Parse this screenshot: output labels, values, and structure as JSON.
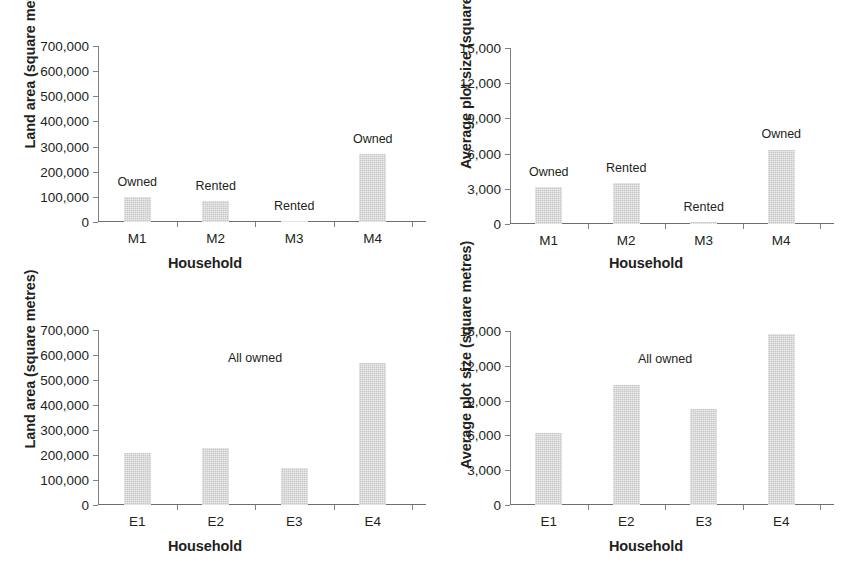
{
  "figure": {
    "bar_color": "#c8c8c8",
    "axis_color": "#808080",
    "text_color": "#231f20"
  },
  "chart_data": [
    {
      "id": "panel-top-left",
      "type": "bar",
      "title": "",
      "xlabel": "Household",
      "ylabel": "Land area (square metres)",
      "categories": [
        "M1",
        "M2",
        "M3",
        "M4"
      ],
      "values": [
        98000,
        82000,
        2000,
        270000
      ],
      "annotations": [
        "Owned",
        "Rented",
        "Rented",
        "Owned"
      ],
      "ylim": [
        0,
        700000
      ],
      "yticks": [
        0,
        100000,
        200000,
        300000,
        400000,
        500000,
        600000,
        700000
      ],
      "ytick_labels": [
        "0",
        "100,000",
        "200,000",
        "300,000",
        "400,000",
        "500,000",
        "600,000",
        "700,000"
      ],
      "grid": false,
      "legend": "none"
    },
    {
      "id": "panel-top-right",
      "type": "bar",
      "title": "",
      "xlabel": "Household",
      "ylabel": "Average plot size (square metres)",
      "categories": [
        "M1",
        "M2",
        "M3",
        "M4"
      ],
      "values": [
        3150,
        3500,
        150,
        6350
      ],
      "annotations": [
        "Owned",
        "Rented",
        "Rented",
        "Owned"
      ],
      "ylim": [
        0,
        15000
      ],
      "yticks": [
        0,
        3000,
        6000,
        9000,
        12000,
        15000
      ],
      "ytick_labels": [
        "0",
        "3,000",
        "6,000",
        "9,000",
        "12,000",
        "15,000"
      ],
      "grid": false,
      "legend": "none"
    },
    {
      "id": "panel-bottom-left",
      "type": "bar",
      "title": "",
      "xlabel": "Household",
      "ylabel": "Land area (square metres)",
      "categories": [
        "E1",
        "E2",
        "E3",
        "E4"
      ],
      "values": [
        210000,
        228000,
        148000,
        567000
      ],
      "annotations": [
        "",
        "",
        "",
        ""
      ],
      "panel_note": "All owned",
      "ylim": [
        0,
        700000
      ],
      "yticks": [
        0,
        100000,
        200000,
        300000,
        400000,
        500000,
        600000,
        700000
      ],
      "ytick_labels": [
        "0",
        "100,000",
        "200,000",
        "300,000",
        "400,000",
        "500,000",
        "600,000",
        "700,000"
      ],
      "grid": false,
      "legend": "none"
    },
    {
      "id": "panel-bottom-right",
      "type": "bar",
      "title": "",
      "xlabel": "Household",
      "ylabel": "Average plot size (square metres)",
      "categories": [
        "E1",
        "E2",
        "E3",
        "E4"
      ],
      "values": [
        6250,
        10350,
        8250,
        14700
      ],
      "annotations": [
        "",
        "",
        "",
        ""
      ],
      "panel_note": "All owned",
      "ylim": [
        0,
        15000
      ],
      "yticks": [
        0,
        3000,
        6000,
        9000,
        12000,
        15000
      ],
      "ytick_labels": [
        "0",
        "3,000",
        "6,000",
        "9,000",
        "12,000",
        "15,000"
      ],
      "grid": false,
      "legend": "none"
    }
  ]
}
